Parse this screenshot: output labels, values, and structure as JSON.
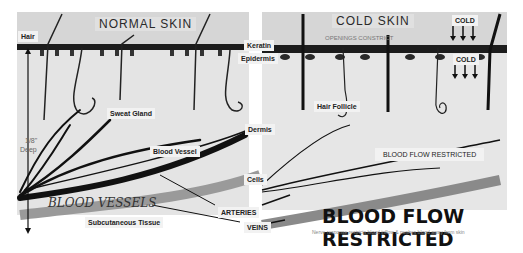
{
  "panels": {
    "normal": {
      "title": "NORMAL SKIN"
    },
    "cold": {
      "title": "COLD SKIN",
      "note": "OPENINGS CONSTRICT"
    }
  },
  "labels": {
    "hair": "Hair",
    "depth_value": "1/8\"",
    "depth_label": "Deep",
    "sweat_gland": "Sweat Gland",
    "blood_vessel": "Blood Vessel",
    "blood_vessels_script": "BLOOD VESSELS",
    "subcutaneous": "Subcutaneous Tissue",
    "keratin": "Keratin",
    "epidermis": "Epidermis",
    "dermis": "Dermis",
    "cells": "Cells",
    "arteries": "ARTERIES",
    "veins": "VEINS",
    "hair_follicle": "Hair Follicle",
    "cold_top": "COLD",
    "cold_bottom": "COLD",
    "blood_flow_box": "BLOOD FLOW RESTRICTED",
    "blood_flow_headline": "BLOOD FLOW RESTRICTED",
    "caption": "Nerve response restricts blood inflow & pushes blood away from skin"
  },
  "colors": {
    "background": "#ffffff",
    "panel": "#d6d6d6",
    "keratin_band": "#1a1a1a",
    "ink": "#111111"
  }
}
